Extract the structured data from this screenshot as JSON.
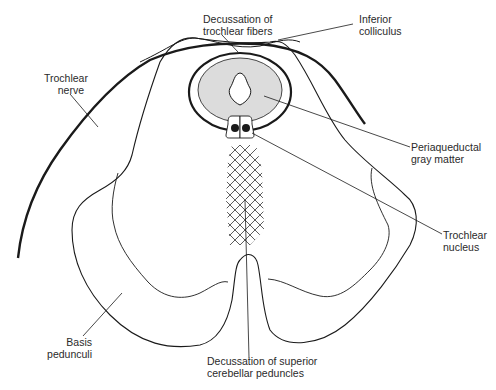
{
  "diagram": {
    "labels": {
      "decussation_trochlear": {
        "line1": "Decussation of",
        "line2": "trochlear fibers"
      },
      "inferior_colliculus": {
        "line1": "Inferior",
        "line2": "colliculus"
      },
      "trochlear_nerve": {
        "line1": "Trochlear",
        "line2": "nerve"
      },
      "periaqueductal": {
        "line1": "Periaqueductal",
        "line2": "gray matter"
      },
      "trochlear_nucleus": {
        "line1": "Trochlear",
        "line2": "nucleus"
      },
      "basis_pedunculi": {
        "line1": "Basis",
        "line2": "pedunculi"
      },
      "decussation_scp": {
        "line1": "Decussation of superior",
        "line2": "cerebellar peduncles"
      }
    },
    "colors": {
      "stroke": "#1a1a1a",
      "gray_matter_fill": "#dcdcdc",
      "background": "#ffffff"
    }
  }
}
